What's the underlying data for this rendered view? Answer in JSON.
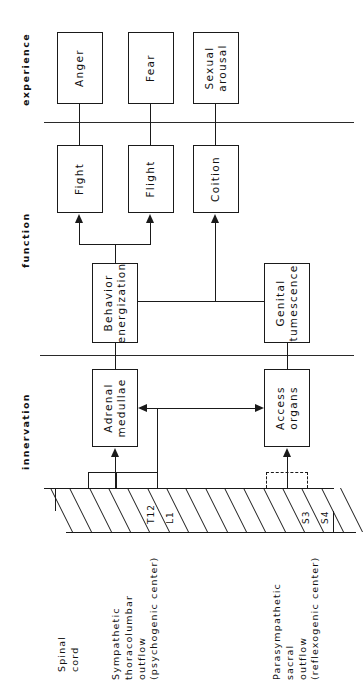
{
  "diagram": {
    "orientation": "rotated-90-ccw",
    "row_labels": [
      {
        "id": "experience",
        "label": "experience"
      },
      {
        "id": "function",
        "label": "function"
      },
      {
        "id": "innervation",
        "label": "innervation"
      }
    ],
    "experience_boxes": [
      {
        "id": "anger",
        "label": "Anger"
      },
      {
        "id": "fear",
        "label": "Fear"
      },
      {
        "id": "sexual-arousal",
        "label": "Sexual\narousal"
      }
    ],
    "function_boxes": [
      {
        "id": "fight",
        "label": "Fight"
      },
      {
        "id": "flight",
        "label": "Flight"
      },
      {
        "id": "coition",
        "label": "Coition"
      }
    ],
    "mediator_boxes": [
      {
        "id": "behavior-energization",
        "label": "Behavior\nenergization"
      },
      {
        "id": "genital-tumescence",
        "label": "Genital\ntumescence"
      }
    ],
    "innervation_boxes": [
      {
        "id": "adrenal-medullae",
        "label": "Adrenal\nmedullae"
      },
      {
        "id": "access-organs",
        "label": "Access\norgans"
      }
    ],
    "cord": {
      "caption_spinal": "Spinal\ncord",
      "segment_count": 15,
      "segment_labels": [
        {
          "index": 4,
          "label": "T12"
        },
        {
          "index": 5,
          "label": "L1"
        },
        {
          "index": 12,
          "label": "S3"
        },
        {
          "index": 13,
          "label": "S4"
        }
      ],
      "sympathetic_caption": "Sympathetic\nthoracolumbar\noutflow\n(psychogenic center)",
      "parasympathetic_caption": "Parasympathetic\nsacral\noutflow\n(reflexogenic center)"
    },
    "colors": {
      "ink": "#1a1a1a",
      "paper": "#ffffff"
    }
  }
}
